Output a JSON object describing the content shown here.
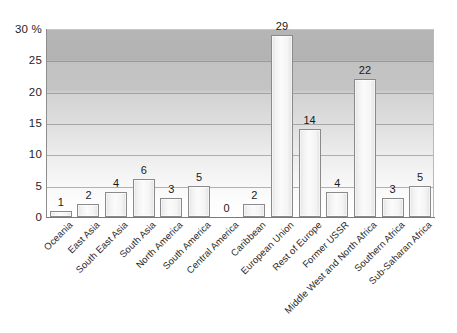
{
  "chart_data": {
    "type": "bar",
    "title": "",
    "subtitle": "",
    "xlabel": "",
    "ylabel": "",
    "unit": "%",
    "ylim": [
      0,
      30
    ],
    "grid": true,
    "legend": false,
    "categories": [
      "Oceania",
      "East Asia",
      "South East Asia",
      "South Asia",
      "North America",
      "South America",
      "Central America",
      "Caribbean",
      "European Union",
      "Rest of Europe",
      "Former USSR",
      "Middle West and North Africa",
      "Southern Africa",
      "Sub-Saharan Africa"
    ],
    "values": [
      1,
      2,
      4,
      6,
      3,
      5,
      0,
      2,
      29,
      14,
      4,
      22,
      3,
      5
    ],
    "value_labels": [
      "1",
      "2",
      "4",
      "6",
      "3",
      "5",
      "0",
      "2",
      "29",
      "14",
      "4",
      "22",
      "3",
      "5"
    ],
    "y_ticks": [
      0,
      5,
      10,
      15,
      20,
      25,
      30
    ],
    "y_tick_labels": [
      "0",
      "5",
      "10",
      "15",
      "20",
      "25",
      "30 %"
    ]
  },
  "style": {
    "bar_border": "#8a8a8a",
    "bar_fill": "#f4f4f4",
    "axis_color": "#7a7a7a",
    "gridline_color": "#787878",
    "text_color": "#1e1e1e",
    "plot_bg_top": "#b5b5b5",
    "plot_bg_bottom": "#ffffff"
  }
}
